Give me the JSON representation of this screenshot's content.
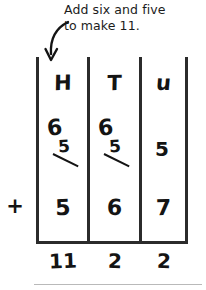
{
  "instruction": {
    "line1": "Add six and five",
    "line2": "to make 11."
  },
  "annotation": {
    "arrow_icon": "curved-down-arrow-icon",
    "points_to": "H"
  },
  "worksheet": {
    "type": "place-value-column-addition",
    "columns": [
      {
        "key": "hundreds",
        "header": "H",
        "addend_one_original": "6",
        "addend_one_struck": "5",
        "has_strikethrough": true,
        "addend_two": "5",
        "answer": "11"
      },
      {
        "key": "tens",
        "header": "T",
        "addend_one_original": "6",
        "addend_one_struck": "5",
        "has_strikethrough": true,
        "addend_two": "6",
        "answer": "2"
      },
      {
        "key": "units",
        "header": "u",
        "addend_one_original": "5",
        "addend_one_struck": "",
        "has_strikethrough": false,
        "addend_two": "7",
        "answer": "2"
      }
    ],
    "operator": "+"
  },
  "colors": {
    "ink": "#141414",
    "grid_line": "#2b2b2b",
    "page_rule": "#b9b9b9",
    "background": "#ffffff"
  }
}
